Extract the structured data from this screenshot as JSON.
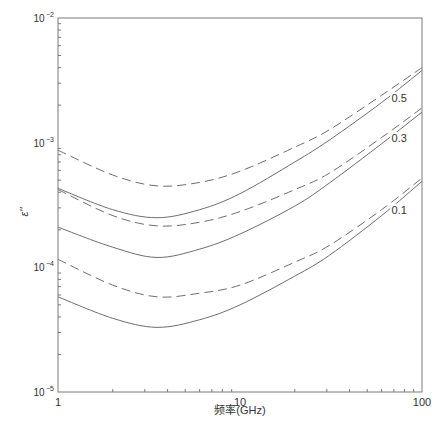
{
  "chart_data": {
    "type": "line",
    "title": "",
    "xlabel": "频率(GHz)",
    "ylabel": "ε''",
    "xscale": "log",
    "yscale": "log",
    "xlim": [
      1,
      100
    ],
    "ylim": [
      1e-05,
      0.01
    ],
    "grid": false,
    "legend": "none (inline curve labels)",
    "x_tick_labels": [
      "1",
      "10",
      "100"
    ],
    "y_tick_labels": [
      {
        "base": "10",
        "exp": "-2"
      },
      {
        "base": "10",
        "exp": "-3"
      },
      {
        "base": "10",
        "exp": "-4"
      },
      {
        "base": "10",
        "exp": "-5"
      }
    ],
    "x": [
      1,
      2,
      3.5,
      6,
      10,
      20,
      31,
      60,
      100
    ],
    "series": [
      {
        "name": "0.5 (dashed)",
        "group": "0.5",
        "style": "dashed",
        "values": [
          0.00087,
          0.00055,
          0.00045,
          0.00048,
          0.00059,
          0.00092,
          0.00127,
          0.0024,
          0.004
        ]
      },
      {
        "name": "0.5 (solid)",
        "group": "0.5",
        "style": "solid",
        "values": [
          0.00043,
          0.00029,
          0.00025,
          0.00029,
          0.00039,
          0.0007,
          0.00105,
          0.0021,
          0.0038
        ]
      },
      {
        "name": "0.3 (dashed)",
        "group": "0.3",
        "style": "dashed",
        "values": [
          0.00042,
          0.00026,
          0.000215,
          0.00023,
          0.00028,
          0.00042,
          0.00057,
          0.0011,
          0.0019
        ]
      },
      {
        "name": "0.3 (solid)",
        "group": "0.3",
        "style": "solid",
        "values": [
          0.00021,
          0.000145,
          0.00012,
          0.00014,
          0.000185,
          0.00031,
          0.000475,
          0.00098,
          0.00176
        ]
      },
      {
        "name": "0.1 (dashed)",
        "group": "0.1",
        "style": "dashed",
        "values": [
          0.000116,
          7.2e-05,
          5.8e-05,
          6.2e-05,
          7.2e-05,
          0.00011,
          0.00015,
          0.00029,
          0.00052
        ]
      },
      {
        "name": "0.1 (solid)",
        "group": "0.1",
        "style": "solid",
        "values": [
          5.8e-05,
          3.9e-05,
          3.3e-05,
          3.8e-05,
          5e-05,
          8.5e-05,
          0.000125,
          0.00026,
          0.00049
        ]
      }
    ],
    "annotations": [
      {
        "text": "0.5",
        "near_x": 75,
        "near_y": 0.0022
      },
      {
        "text": "0.3",
        "near_x": 75,
        "near_y": 0.00105
      },
      {
        "text": "0.1",
        "near_x": 75,
        "near_y": 0.00028
      }
    ]
  },
  "labels": {
    "xlabel": "频率(GHz)",
    "ylabel": "ε''",
    "curve_labels": [
      "0.5",
      "0.3",
      "0.1"
    ]
  }
}
